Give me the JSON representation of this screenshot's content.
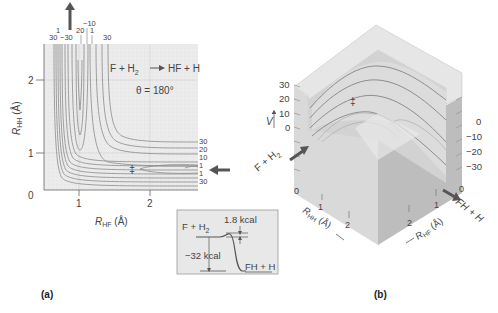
{
  "panel_a": {
    "label": "(a)",
    "reaction": "F + H2 → HF + H",
    "reaction_parts": {
      "lhs": "F + H",
      "sub": "2",
      "rhs": "HF + H"
    },
    "angle": "θ = 180°",
    "x_axis": {
      "label": "R",
      "sub": "HF",
      "unit": "(Å)",
      "ticks": [
        "1",
        "2"
      ]
    },
    "y_axis": {
      "label": "R",
      "sub": "HH",
      "unit": "(Å)",
      "ticks": [
        "0",
        "1",
        "2"
      ]
    },
    "top_contour_labels": [
      "30",
      "1",
      "−30",
      "20",
      "−10",
      "1",
      "30"
    ],
    "right_contour_labels": [
      "30",
      "20",
      "10",
      "1",
      "1",
      "30"
    ],
    "saddle_marker": "‡",
    "inset": {
      "reactants": "F + H",
      "reactants_sub": "2",
      "barrier": "1.8 kcal",
      "exothermicity": "−32 kcal",
      "products": "FH + H"
    }
  },
  "panel_b": {
    "label": "(b)",
    "v_axis": "V",
    "left_ticks": [
      "30",
      "20",
      "10",
      "0"
    ],
    "right_ticks": [
      "0",
      "−10",
      "−20",
      "−30"
    ],
    "reactant_arrow": "F + H2",
    "reactant_parts": {
      "a": "F + H",
      "sub": "2"
    },
    "product_arrow": "FH + H",
    "rhh_axis": {
      "label": "R",
      "sub": "HH",
      "unit": "(Å)",
      "ticks": [
        "0",
        "1",
        "2"
      ]
    },
    "rhf_axis": {
      "label": "R",
      "sub": "HF",
      "unit": "(Å)",
      "ticks": [
        "0",
        "1",
        "2"
      ]
    },
    "saddle_marker": "‡"
  },
  "colors": {
    "plot_bg": "#e9e9e9",
    "contour": "#8a8a8a",
    "arrow": "#555555",
    "cube_left": "#d4d4d4",
    "cube_right": "#bdbdbd",
    "cube_top": "#e4e4e4"
  }
}
